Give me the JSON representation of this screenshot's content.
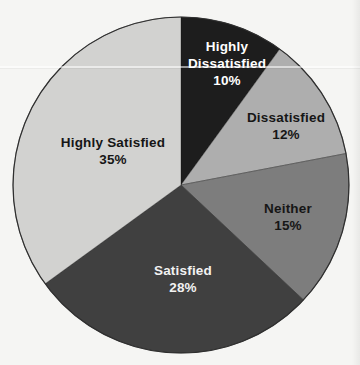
{
  "figure": {
    "background": "#f5f5f3"
  },
  "chart_data": {
    "type": "pie",
    "title": "",
    "categories": [
      "Highly Dissatisfied",
      "Dissatisfied",
      "Neither",
      "Satisfied",
      "Highly Satisfied"
    ],
    "values": [
      10,
      12,
      15,
      28,
      35
    ],
    "value_labels": [
      "10%",
      "12%",
      "15%",
      "28%",
      "35%"
    ],
    "colors": [
      "#1d1d1d",
      "#aeaeae",
      "#7d7d7d",
      "#404040",
      "#d2d2d0"
    ],
    "text_colors": [
      "#ffffff",
      "#161616",
      "#161616",
      "#f2f2f2",
      "#161616"
    ],
    "start_angle": "top",
    "direction": "clockwise",
    "legend": "none",
    "labels_on_slices": true,
    "outline_color": "#2f2f2f"
  }
}
